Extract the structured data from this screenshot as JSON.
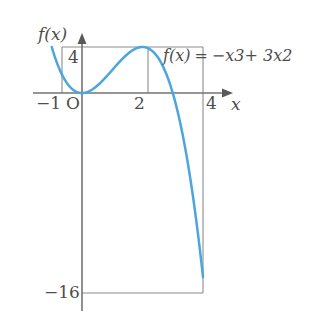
{
  "figure": {
    "kind": "cubic-function-graph",
    "background_color": "#ffffff",
    "curve_color": "#4BA6DE",
    "axis_color": "#808080",
    "text_color": "#4d4d4d"
  },
  "axes": {
    "y_axis_label": "f(x)",
    "x_axis_label": "x",
    "origin_label": "O",
    "x_tick_labels": [
      "−1",
      "2",
      "4"
    ],
    "y_tick_labels": [
      "4",
      "−16"
    ]
  },
  "equation": {
    "lhs": "f(x)",
    "equals": "=",
    "rhs": "−x3+ 3x2",
    "full": "f(x) = −x3+ 3x2"
  },
  "chart_data": {
    "type": "line",
    "title": "",
    "xlabel": "x",
    "ylabel": "f(x)",
    "expression": "f(x) = -x^3 + 3x^2",
    "xlim": [
      -1,
      4
    ],
    "ylim": [
      -16,
      4
    ],
    "grid": false,
    "legend": "none",
    "x_ticks": [
      -1,
      2,
      4
    ],
    "y_ticks": [
      4,
      -16
    ],
    "series": [
      {
        "name": "f(x) = -x^3 + 3x^2",
        "color": "#4BA6DE",
        "x": [
          -1,
          -0.8,
          -0.6,
          -0.4,
          -0.2,
          0,
          0.2,
          0.4,
          0.6,
          0.8,
          1,
          1.2,
          1.4,
          1.6,
          1.8,
          2,
          2.2,
          2.4,
          2.6,
          2.8,
          3,
          3.2,
          3.4,
          3.6,
          3.8,
          4
        ],
        "y": [
          4,
          2.432,
          1.296,
          0.544,
          0.128,
          0,
          0.112,
          0.416,
          0.864,
          1.408,
          2,
          2.592,
          3.136,
          3.584,
          3.888,
          4,
          3.872,
          3.456,
          2.704,
          1.568,
          0,
          -2.048,
          -4.624,
          -7.776,
          -11.552,
          -16
        ]
      }
    ],
    "annotations": [
      {
        "text": "4",
        "x": 0,
        "y": 4,
        "role": "y-tick"
      },
      {
        "text": "−16",
        "x": 0,
        "y": -16,
        "role": "y-tick"
      },
      {
        "text": "−1",
        "x": -1,
        "y": 0,
        "role": "x-tick"
      },
      {
        "text": "O",
        "x": 0,
        "y": 0,
        "role": "origin"
      },
      {
        "text": "2",
        "x": 2,
        "y": 0,
        "role": "x-tick"
      },
      {
        "text": "4",
        "x": 4,
        "y": 0,
        "role": "x-tick"
      },
      {
        "text": "f(x) = −x3+ 3x2",
        "x": 2.1,
        "y": 3.8,
        "role": "equation"
      }
    ],
    "reference_lines": [
      {
        "orientation": "horizontal",
        "value": 4,
        "from": -1,
        "to": 4
      },
      {
        "orientation": "horizontal",
        "value": -16,
        "from": 0,
        "to": 4
      },
      {
        "orientation": "vertical",
        "value": -1,
        "from": 0,
        "to": 4
      },
      {
        "orientation": "vertical",
        "value": 2,
        "from": 0,
        "to": 4
      },
      {
        "orientation": "vertical",
        "value": 4,
        "from": -16,
        "to": 4
      }
    ],
    "key_points": [
      {
        "label": "left endpoint",
        "x": -1,
        "y": 4
      },
      {
        "label": "local minimum",
        "x": 0,
        "y": 0
      },
      {
        "label": "local maximum",
        "x": 2,
        "y": 4
      },
      {
        "label": "x-intercept",
        "x": 3,
        "y": 0
      },
      {
        "label": "right endpoint",
        "x": 4,
        "y": -16
      }
    ]
  }
}
